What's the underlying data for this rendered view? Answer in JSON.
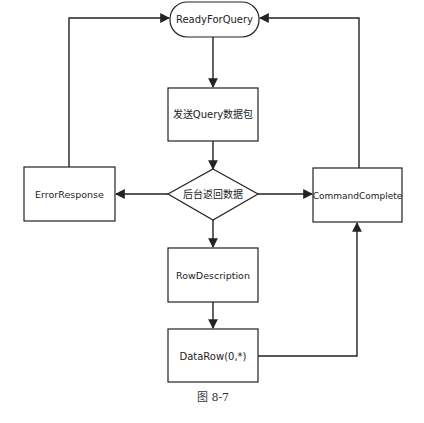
{
  "diagram": {
    "type": "flowchart",
    "nodes": {
      "ready": {
        "label": "ReadyForQuery",
        "shape": "rounded-terminal"
      },
      "send": {
        "label": "发送Query数据包",
        "shape": "rectangle"
      },
      "decision": {
        "label": "后台返回数据",
        "shape": "diamond"
      },
      "error": {
        "label": "ErrorResponse",
        "shape": "rectangle"
      },
      "complete": {
        "label": "CommandComplete",
        "shape": "rectangle"
      },
      "rowdesc": {
        "label": "RowDescription",
        "shape": "rectangle"
      },
      "datarow": {
        "label": "DataRow(0,*)",
        "shape": "rectangle"
      }
    },
    "edges": [
      {
        "from": "ready",
        "to": "send"
      },
      {
        "from": "send",
        "to": "decision"
      },
      {
        "from": "decision",
        "to": "error"
      },
      {
        "from": "decision",
        "to": "complete"
      },
      {
        "from": "decision",
        "to": "rowdesc"
      },
      {
        "from": "rowdesc",
        "to": "datarow"
      },
      {
        "from": "datarow",
        "to": "complete"
      },
      {
        "from": "error",
        "to": "ready"
      },
      {
        "from": "complete",
        "to": "ready"
      }
    ],
    "caption": "图 8-7"
  }
}
